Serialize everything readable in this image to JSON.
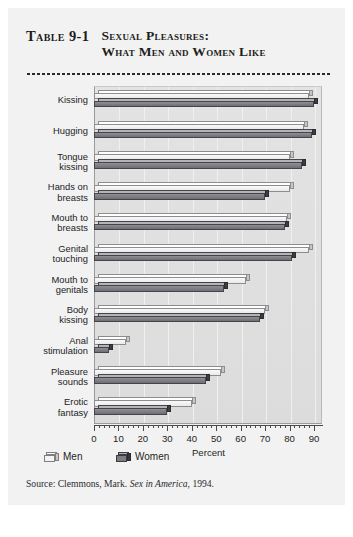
{
  "figure": {
    "table_number": "Table 9-1",
    "title_line1": "Sexual Pleasures:",
    "title_line2": "What Men and Women Like",
    "source_prefix": "Source: Clemmons, Mark.",
    "source_italic": "Sex in America",
    "source_suffix": ", 1994."
  },
  "legend": {
    "men_label": "Men",
    "women_label": "Women"
  },
  "chart_data": {
    "type": "bar",
    "orientation": "horizontal",
    "title": "Sexual Pleasures: What Men and Women Like",
    "xlabel": "Percent",
    "ylabel": "",
    "xlim": [
      0,
      90
    ],
    "xticks": [
      0,
      10,
      20,
      30,
      40,
      50,
      60,
      70,
      80,
      90
    ],
    "xtick_labels": [
      "0",
      "10",
      "20",
      "30",
      "40",
      "50",
      "60",
      "70",
      "80",
      "90"
    ],
    "grid": true,
    "legend_position": "below-axis",
    "categories": [
      "Kissing",
      "Hugging",
      "Tongue kissing",
      "Hands on breasts",
      "Mouth to breasts",
      "Genital touching",
      "Mouth to genitals",
      "Body kissing",
      "Anal stimulation",
      "Pleasure sounds",
      "Erotic fantasy"
    ],
    "category_lines": [
      [
        "Kissing"
      ],
      [
        "Hugging"
      ],
      [
        "Tongue",
        "kissing"
      ],
      [
        "Hands on",
        "breasts"
      ],
      [
        "Mouth to",
        "breasts"
      ],
      [
        "Genital",
        "touching"
      ],
      [
        "Mouth to",
        "genitals"
      ],
      [
        "Body",
        "kissing"
      ],
      [
        "Anal",
        "stimulation"
      ],
      [
        "Pleasure",
        "sounds"
      ],
      [
        "Erotic",
        "fantasy"
      ]
    ],
    "series": [
      {
        "name": "Men",
        "color": "#f0f0f0",
        "values": [
          88,
          86,
          80,
          80,
          79,
          88,
          62,
          70,
          13,
          52,
          40
        ]
      },
      {
        "name": "Women",
        "color": "#77777d",
        "values": [
          90,
          89,
          85,
          70,
          78,
          81,
          53,
          68,
          6,
          46,
          30
        ]
      }
    ]
  }
}
